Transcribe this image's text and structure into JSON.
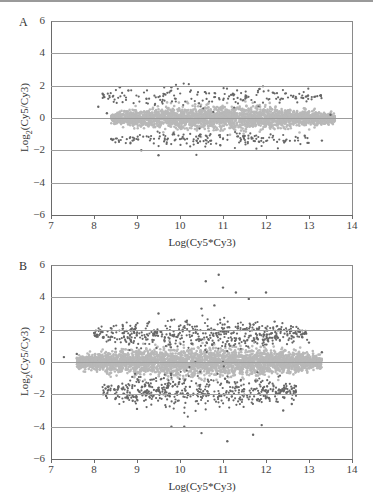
{
  "chart_data": [
    {
      "panel": "A",
      "type": "scatter",
      "title": "",
      "xlabel": "Log(Cy5*Cy3)",
      "ylabel_prefix": "Log",
      "ylabel_sub": "2",
      "ylabel_suffix": "(Cy5/Cy3)",
      "xlim": [
        7,
        14
      ],
      "ylim": [
        -6,
        6
      ],
      "xticks": [
        "7",
        "8",
        "9",
        "10",
        "11",
        "12",
        "13",
        "14"
      ],
      "yticks": [
        "6",
        "4",
        "2",
        "0",
        "−2",
        "−4",
        "−6"
      ],
      "grid": "horizontal",
      "series": [
        {
          "name": "non-differential",
          "color": "#b8b8b8",
          "cloud": {
            "x_min": 8.4,
            "x_max": 13.6,
            "y_center": 0.0,
            "y_spread": 0.65,
            "count": 2600
          }
        },
        {
          "name": "up-regulated",
          "color": "#666666",
          "cloud": {
            "x_min": 8.2,
            "x_max": 13.4,
            "y_center": 1.3,
            "y_spread": 0.35,
            "count": 180
          }
        },
        {
          "name": "down-regulated",
          "color": "#666666",
          "cloud": {
            "x_min": 8.4,
            "x_max": 13.0,
            "y_center": -1.35,
            "y_spread": 0.3,
            "count": 170
          }
        }
      ],
      "outliers": [
        [
          8.1,
          0.7
        ],
        [
          8.2,
          1.5
        ],
        [
          8.3,
          0.3
        ],
        [
          8.6,
          1.9
        ],
        [
          8.8,
          1.7
        ],
        [
          8.9,
          -1.4
        ],
        [
          9.1,
          -2.0
        ],
        [
          9.5,
          -2.3
        ],
        [
          8.4,
          -1.3
        ],
        [
          9.8,
          1.9
        ],
        [
          12.9,
          -1.1
        ],
        [
          13.3,
          -1.4
        ],
        [
          13.5,
          0.2
        ]
      ]
    },
    {
      "panel": "B",
      "type": "scatter",
      "title": "",
      "xlabel": "Log(Cy5*Cy3)",
      "ylabel_prefix": "Log",
      "ylabel_sub": "2",
      "ylabel_suffix": "(Cy5/Cy3)",
      "xlim": [
        7,
        14
      ],
      "ylim": [
        -6,
        6
      ],
      "xticks": [
        "7",
        "8",
        "9",
        "10",
        "11",
        "12",
        "13",
        "14"
      ],
      "yticks": [
        "6",
        "4",
        "2",
        "0",
        "−2",
        "−4",
        "−6"
      ],
      "grid": "horizontal",
      "series": [
        {
          "name": "non-differential",
          "color": "#b8b8b8",
          "cloud": {
            "x_min": 7.6,
            "x_max": 13.3,
            "y_center": 0.0,
            "y_spread": 0.8,
            "count": 3200
          }
        },
        {
          "name": "up-regulated",
          "color": "#666666",
          "cloud": {
            "x_min": 8.0,
            "x_max": 13.0,
            "y_center": 1.7,
            "y_spread": 0.5,
            "count": 520
          }
        },
        {
          "name": "down-regulated",
          "color": "#666666",
          "cloud": {
            "x_min": 8.2,
            "x_max": 12.7,
            "y_center": -1.8,
            "y_spread": 0.55,
            "count": 520
          }
        }
      ],
      "outliers": [
        [
          7.3,
          0.3
        ],
        [
          7.6,
          0.5
        ],
        [
          8.9,
          -2.4
        ],
        [
          9.0,
          -2.9
        ],
        [
          9.8,
          -4.0
        ],
        [
          10.1,
          -4.0
        ],
        [
          10.5,
          -4.4
        ],
        [
          11.1,
          -4.9
        ],
        [
          11.7,
          -4.5
        ],
        [
          11.9,
          -3.9
        ],
        [
          10.6,
          5.0
        ],
        [
          10.9,
          5.4
        ],
        [
          11.0,
          4.6
        ],
        [
          11.3,
          4.3
        ],
        [
          11.6,
          3.9
        ],
        [
          12.0,
          4.3
        ],
        [
          10.5,
          3.3
        ],
        [
          10.8,
          3.5
        ],
        [
          9.5,
          3.0
        ],
        [
          9.8,
          2.6
        ],
        [
          12.2,
          2.5
        ],
        [
          13.0,
          1.2
        ],
        [
          13.3,
          0.6
        ],
        [
          12.6,
          -2.6
        ],
        [
          12.4,
          -3.0
        ]
      ]
    }
  ]
}
